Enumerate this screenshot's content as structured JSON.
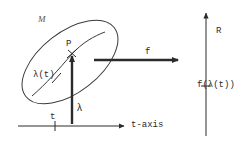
{
  "figure": {
    "width": 243,
    "height": 143,
    "background_color": "#ffffff",
    "stroke_color": "#2b2b2b",
    "faint_stroke_color": "#555555"
  },
  "labels": {
    "manifold": "M",
    "point": "P",
    "curve_point": "λ(t)",
    "curve": "λ",
    "map": "f",
    "parameter": "t",
    "t_axis": "t-axis",
    "reals": "R",
    "image_value": "f(λ(t))"
  },
  "elements": {
    "manifold_ellipse": {
      "name": "manifold-ellipse",
      "center_x": 70,
      "center_y": 62,
      "radius_x": 56,
      "radius_y": 30,
      "rotation_deg": -38
    },
    "curve_through_point": {
      "name": "curve-lambda-path",
      "from_x": 32,
      "from_y": 95,
      "to_x": 105,
      "to_y": 33
    },
    "lambda_arrow": {
      "name": "lambda-vertical-arrow",
      "from_x": 72,
      "from_y": 124,
      "to_x": 72,
      "to_y": 53
    },
    "f_arrow": {
      "name": "f-horizontal-arrow",
      "from_x": 94,
      "from_y": 60,
      "to_x": 182,
      "to_y": 60
    },
    "t_axis_arrow": {
      "name": "t-axis-arrow",
      "from_x": 18,
      "from_y": 126,
      "to_x": 128,
      "to_y": 126
    },
    "r_axis_arrow": {
      "name": "r-axis-arrow",
      "from_x": 206,
      "from_y": 136,
      "to_x": 206,
      "to_y": 10
    },
    "t_tick": {
      "name": "t-axis-tick",
      "x": 55,
      "y": 126
    },
    "r_tick": {
      "name": "r-axis-tick",
      "x": 206,
      "y": 86
    },
    "point_marker": {
      "name": "point-p-marker",
      "x": 72,
      "y": 53
    }
  }
}
